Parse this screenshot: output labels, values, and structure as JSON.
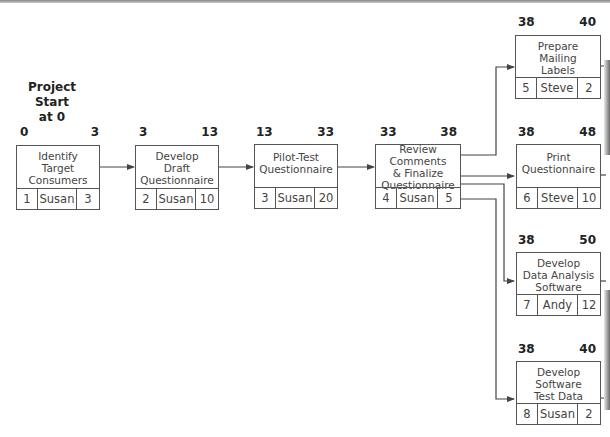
{
  "diagram": {
    "type": "network-diagram",
    "start_label": "Project Start at 0",
    "start_lines": [
      "Project",
      "Start",
      "at 0"
    ],
    "nodes": [
      {
        "id": "1",
        "name": "Identify Target Consumers",
        "lines": [
          "Identify",
          "Target",
          "Consumers"
        ],
        "owner": "Susan",
        "duration": "3",
        "early_start": "0",
        "early_finish": "3"
      },
      {
        "id": "2",
        "name": "Develop Draft Questionnaire",
        "lines": [
          "Develop",
          "Draft",
          "Questionnaire"
        ],
        "owner": "Susan",
        "duration": "10",
        "early_start": "3",
        "early_finish": "13"
      },
      {
        "id": "3",
        "name": "Pilot-Test Questionnaire",
        "lines": [
          "Pilot-Test",
          "Questionnaire"
        ],
        "owner": "Susan",
        "duration": "20",
        "early_start": "13",
        "early_finish": "33"
      },
      {
        "id": "4",
        "name": "Review Comments & Finalize Questionnaire",
        "lines": [
          "Review Comments",
          "& Finalize",
          "Questionnaire"
        ],
        "owner": "Susan",
        "duration": "5",
        "early_start": "33",
        "early_finish": "38"
      },
      {
        "id": "5",
        "name": "Prepare Mailing Labels",
        "lines": [
          "Prepare",
          "Mailing",
          "Labels"
        ],
        "owner": "Steve",
        "duration": "2",
        "early_start": "38",
        "early_finish": "40"
      },
      {
        "id": "6",
        "name": "Print Questionnaire",
        "lines": [
          "Print",
          "Questionnaire"
        ],
        "owner": "Steve",
        "duration": "10",
        "early_start": "38",
        "early_finish": "48"
      },
      {
        "id": "7",
        "name": "Develop Data Analysis Software",
        "lines": [
          "Develop",
          "Data Analysis",
          "Software"
        ],
        "owner": "Andy",
        "duration": "12",
        "early_start": "38",
        "early_finish": "50"
      },
      {
        "id": "8",
        "name": "Develop Software Test Data",
        "lines": [
          "Develop",
          "Software",
          "Test Data"
        ],
        "owner": "Susan",
        "duration": "2",
        "early_start": "38",
        "early_finish": "40"
      }
    ],
    "edges": [
      {
        "from": "1",
        "to": "2"
      },
      {
        "from": "2",
        "to": "3"
      },
      {
        "from": "3",
        "to": "4"
      },
      {
        "from": "4",
        "to": "5"
      },
      {
        "from": "4",
        "to": "6"
      },
      {
        "from": "4",
        "to": "7"
      },
      {
        "from": "4",
        "to": "8"
      }
    ],
    "colors": {
      "line": "#444444",
      "box_border": "#555555",
      "text": "#444444",
      "bold_text": "#222222"
    }
  }
}
